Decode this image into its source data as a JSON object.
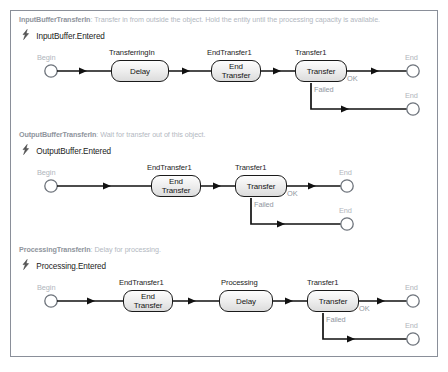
{
  "window": {
    "background": "#ffffff",
    "canvas_border": "#8a8f99"
  },
  "icons": {
    "trigger": "lightning-bolt-icon"
  },
  "colors": {
    "caption": "#b0b5bc",
    "step_border": "#1a1a1a",
    "connector": "#111111",
    "header_text": "#9aa0a8"
  },
  "processes": [
    {
      "name": "InputBufferTransferIn",
      "description": "Transfer in from outside the object. Hold the entity until the processing capacity is available.",
      "trigger": "InputBuffer.Entered",
      "begin_label": "Begin",
      "steps": [
        {
          "title": "TransferringIn",
          "label": "Delay"
        },
        {
          "title": "EndTransfer1",
          "label": "End\nTransfer"
        },
        {
          "title": "Transfer1",
          "label": "Transfer"
        }
      ],
      "branch_ok_label": "OK",
      "branch_failed_label": "Failed",
      "end_labels": [
        "End",
        "End"
      ]
    },
    {
      "name": "OutputBufferTransferIn",
      "description": "Wait for transfer out of this object.",
      "trigger": "OutputBuffer.Entered",
      "begin_label": "Begin",
      "steps": [
        {
          "title": "EndTransfer1",
          "label": "End\nTransfer"
        },
        {
          "title": "Transfer1",
          "label": "Transfer"
        }
      ],
      "branch_ok_label": "OK",
      "branch_failed_label": "Failed",
      "end_labels": [
        "End",
        "End"
      ]
    },
    {
      "name": "ProcessingTransferIn",
      "description": "Delay for processing.",
      "trigger": "Processing.Entered",
      "begin_label": "Begin",
      "steps": [
        {
          "title": "EndTransfer1",
          "label": "End\nTransfer"
        },
        {
          "title": "Processing",
          "label": "Delay"
        },
        {
          "title": "Transfer1",
          "label": "Transfer"
        }
      ],
      "branch_ok_label": "OK",
      "branch_failed_label": "Failed",
      "end_labels": [
        "End",
        "End"
      ]
    }
  ]
}
